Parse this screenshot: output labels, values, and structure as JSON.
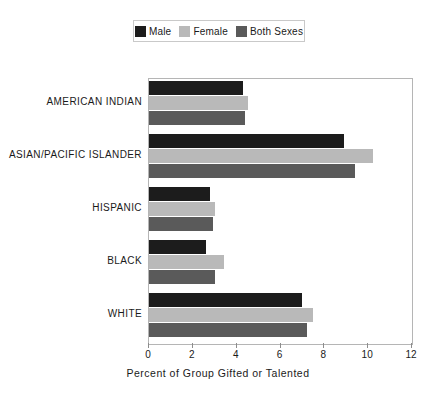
{
  "chart_data": {
    "type": "bar",
    "orientation": "horizontal",
    "title": "",
    "xlabel": "Percent of Group Gifted or Talented",
    "ylabel": "",
    "xlim": [
      0,
      12
    ],
    "xticks": [
      0,
      2,
      4,
      6,
      8,
      10,
      12
    ],
    "grid": false,
    "legend_position": "top",
    "categories": [
      "AMERICAN INDIAN",
      "ASIAN/PACIFIC ISLANDER",
      "HISPANIC",
      "BLACK",
      "WHITE"
    ],
    "series": [
      {
        "name": "Male",
        "color": "#1c1c1c",
        "values": [
          4.3,
          8.9,
          2.8,
          2.6,
          7.0
        ]
      },
      {
        "name": "Female",
        "color": "#b9b9b9",
        "values": [
          4.5,
          10.2,
          3.0,
          3.4,
          7.5
        ]
      },
      {
        "name": "Both Sexes",
        "color": "#5a5a5a",
        "values": [
          4.4,
          9.4,
          2.9,
          3.0,
          7.2
        ]
      }
    ]
  },
  "legend": {
    "entries": [
      {
        "label": "Male",
        "color": "#1c1c1c"
      },
      {
        "label": "Female",
        "color": "#b9b9b9"
      },
      {
        "label": "Both Sexes",
        "color": "#5a5a5a"
      }
    ]
  },
  "axis": {
    "x_title": "Percent of Group Gifted or Talented",
    "tick_labels": [
      "0",
      "2",
      "4",
      "6",
      "8",
      "10",
      "12"
    ]
  },
  "category_labels": [
    "AMERICAN INDIAN",
    "ASIAN/PACIFIC ISLANDER",
    "HISPANIC",
    "BLACK",
    "WHITE"
  ]
}
